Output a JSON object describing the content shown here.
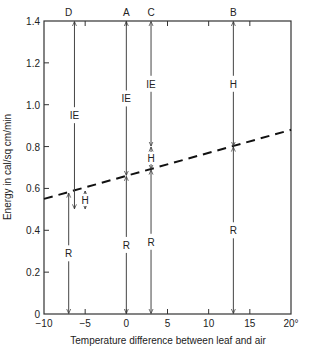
{
  "chart_data": {
    "type": "line",
    "title": "",
    "xlabel": "Temperature difference between leaf and air",
    "ylabel": "Energy in cal/sq cm/min",
    "xlim": [
      -10,
      20
    ],
    "ylim": [
      0,
      1.4
    ],
    "x_ticks": [
      -10,
      -5,
      0,
      5,
      10,
      15,
      20
    ],
    "x_tick_labels": [
      "−10",
      "−5",
      "0",
      "5",
      "10",
      "15",
      "20°"
    ],
    "y_ticks": [
      0,
      0.2,
      0.4,
      0.6,
      0.8,
      1.0,
      1.2,
      1.4
    ],
    "y_tick_labels": [
      "0",
      "0.2",
      "0.4",
      "0.6",
      "0.8",
      "1.0",
      "1.2",
      "1.4"
    ],
    "grid": false,
    "series": [
      {
        "name": "dashed line (R + H balance)",
        "style": "dashed",
        "x": [
          -10,
          20
        ],
        "y": [
          0.55,
          0.88
        ]
      }
    ],
    "cases": [
      {
        "label": "D",
        "x": -7,
        "segments": [
          {
            "label": "R",
            "from": 0,
            "to": 0.58,
            "x": -7
          },
          {
            "label": "IE",
            "from": 1.4,
            "to": 0.5,
            "x": -6.3
          },
          {
            "label": "H",
            "from": 0.59,
            "to": 0.5,
            "x": -5
          }
        ]
      },
      {
        "label": "A",
        "x": 0,
        "segments": [
          {
            "label": "R",
            "from": 0,
            "to": 0.66,
            "x": 0
          },
          {
            "label": "IE",
            "from": 1.4,
            "to": 0.66,
            "x": 0
          }
        ]
      },
      {
        "label": "C",
        "x": 3,
        "segments": [
          {
            "label": "R",
            "from": 0,
            "to": 0.69,
            "x": 3
          },
          {
            "label": "H",
            "from": 0.8,
            "to": 0.69,
            "x": 3
          },
          {
            "label": "IE",
            "from": 1.4,
            "to": 0.8,
            "x": 3
          }
        ]
      },
      {
        "label": "B",
        "x": 13,
        "segments": [
          {
            "label": "R",
            "from": 0,
            "to": 0.8,
            "x": 13
          },
          {
            "label": "H",
            "from": 1.4,
            "to": 0.8,
            "x": 13
          }
        ]
      }
    ]
  }
}
